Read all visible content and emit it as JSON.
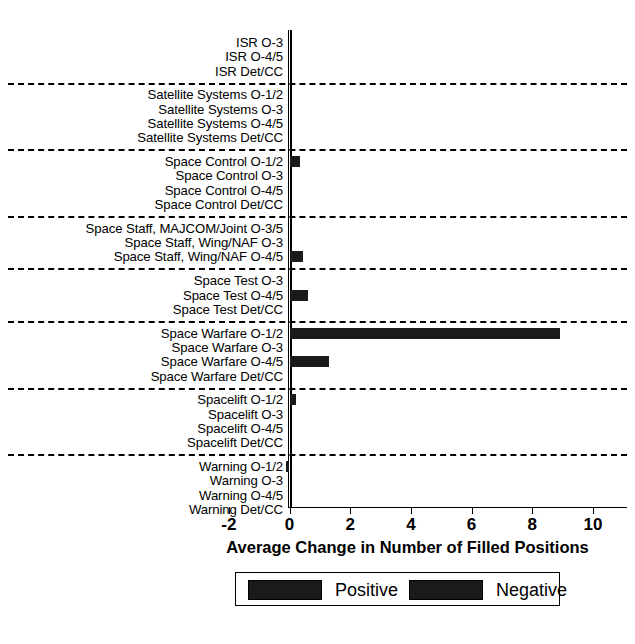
{
  "chart_data": {
    "type": "bar",
    "orientation": "horizontal",
    "title": "",
    "xlabel": "Average Change in Number of Filled Positions",
    "ylabel": "",
    "xlim": [
      -2,
      10
    ],
    "xticks": [
      -2,
      0,
      2,
      4,
      6,
      8,
      10
    ],
    "xticklabels": [
      "-2",
      "0",
      "2",
      "4",
      "6",
      "8",
      "10"
    ],
    "grid": false,
    "legend": {
      "position": "below-axes",
      "entries": [
        {
          "label": "Positive",
          "color": "#1a1a1a"
        },
        {
          "label": "Negative",
          "color": "#1a1a1a"
        }
      ]
    },
    "groups": [
      {
        "name": "ISR",
        "categories": [
          "ISR O-3",
          "ISR O-4/5",
          "ISR Det/CC"
        ],
        "values": [
          0,
          0,
          0
        ]
      },
      {
        "name": "Satellite Systems",
        "categories": [
          "Satellite Systems O-1/2",
          "Satellite Systems O-3",
          "Satellite Systems O-4/5",
          "Satellite Systems Det/CC"
        ],
        "values": [
          0,
          0,
          0,
          0
        ]
      },
      {
        "name": "Space Control",
        "categories": [
          "Space Control O-1/2",
          "Space Control O-3",
          "Space Control O-4/5",
          "Space Control Det/CC"
        ],
        "values": [
          0.35,
          0,
          0,
          0
        ]
      },
      {
        "name": "Space Staff",
        "categories": [
          "Space Staff, MAJCOM/Joint O-3/5",
          "Space Staff, Wing/NAF O-3",
          "Space Staff, Wing/NAF O-4/5"
        ],
        "values": [
          0,
          0,
          0.45
        ]
      },
      {
        "name": "Space Test",
        "categories": [
          "Space Test O-3",
          "Space Test O-4/5",
          "Space Test Det/CC"
        ],
        "values": [
          0,
          0.6,
          0
        ]
      },
      {
        "name": "Space Warfare",
        "categories": [
          "Space Warfare O-1/2",
          "Space Warfare O-3",
          "Space Warfare O-4/5",
          "Space Warfare Det/CC"
        ],
        "values": [
          8.9,
          0,
          1.3,
          0
        ]
      },
      {
        "name": "Spacelift",
        "categories": [
          "Spacelift O-1/2",
          "Spacelift O-3",
          "Spacelift O-4/5",
          "Spacelift Det/CC"
        ],
        "values": [
          0.2,
          0,
          0,
          0
        ]
      },
      {
        "name": "Warning",
        "categories": [
          "Warning O-1/2",
          "Warning O-3",
          "Warning O-4/5",
          "Warning Det/CC"
        ],
        "values": [
          -0.12,
          0,
          0,
          0
        ]
      }
    ]
  },
  "axis": {
    "xlabel": "Average Change in Number of Filled Positions",
    "ticklabels": [
      "-2",
      "0",
      "2",
      "4",
      "6",
      "8",
      "10"
    ]
  },
  "legend": {
    "positive_label": "Positive",
    "negative_label": "Negative"
  }
}
